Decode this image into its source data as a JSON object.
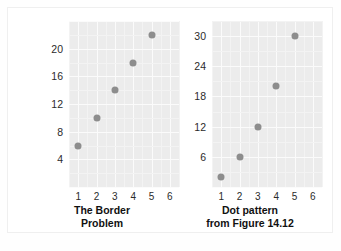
{
  "figure": {
    "background_color": "#ffffff",
    "plot_background_color": "#ececec",
    "grid_color": "#fbfbfb",
    "dot_color": "#8d8d8d"
  },
  "charts": [
    {
      "id": "border-problem",
      "caption_line1": "The Border",
      "caption_line2": "Problem",
      "xticks": [
        "1",
        "2",
        "3",
        "4",
        "5",
        "6"
      ],
      "yticks": [
        "4",
        "8",
        "12",
        "16",
        "20"
      ]
    },
    {
      "id": "dot-pattern",
      "caption_line1": "Dot pattern",
      "caption_line2": "from Figure 14.12",
      "xticks": [
        "1",
        "2",
        "3",
        "4",
        "5",
        "6"
      ],
      "yticks": [
        "6",
        "12",
        "18",
        "24",
        "30"
      ]
    }
  ],
  "chart_data": [
    {
      "type": "scatter",
      "title": "The Border Problem",
      "xlabel": "",
      "ylabel": "",
      "x": [
        1,
        2,
        3,
        4,
        5
      ],
      "values": [
        6,
        10,
        14,
        18,
        22
      ],
      "series": [
        {
          "name": "The Border Problem",
          "x": [
            1,
            2,
            3,
            4,
            5
          ],
          "values": [
            6,
            10,
            14,
            18,
            22
          ]
        }
      ],
      "xlim": [
        0.5,
        6.5
      ],
      "ylim": [
        0,
        24
      ],
      "xticks": [
        1,
        2,
        3,
        4,
        5,
        6
      ],
      "yticks": [
        4,
        8,
        12,
        16,
        20
      ],
      "grid": true,
      "legend": "none"
    },
    {
      "type": "scatter",
      "title": "Dot pattern from Figure 14.12",
      "xlabel": "",
      "ylabel": "",
      "x": [
        1,
        2,
        3,
        4,
        5
      ],
      "values": [
        2,
        6,
        12,
        20,
        30
      ],
      "series": [
        {
          "name": "Dot pattern from Figure 14.12",
          "x": [
            1,
            2,
            3,
            4,
            5
          ],
          "values": [
            2,
            6,
            12,
            20,
            30
          ]
        }
      ],
      "xlim": [
        0.5,
        6.5
      ],
      "ylim": [
        0,
        33
      ],
      "xticks": [
        1,
        2,
        3,
        4,
        5,
        6
      ],
      "yticks": [
        6,
        12,
        18,
        24,
        30
      ],
      "grid": true,
      "legend": "none"
    }
  ]
}
